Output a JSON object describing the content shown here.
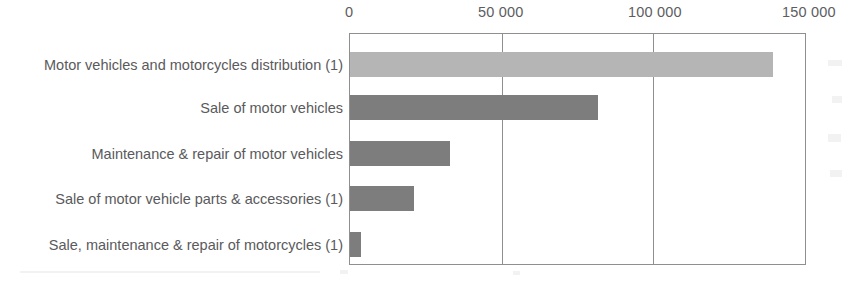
{
  "chart_data": {
    "type": "bar",
    "orientation": "horizontal",
    "title": "",
    "subtitle": "",
    "xlabel": "",
    "ylabel": "",
    "categories": [
      "Motor vehicles and motorcycles distribution (1)",
      "Sale of motor vehicles",
      "Maintenance & repair of motor vehicles",
      "Sale of motor vehicle parts & accessories (1)",
      "Sale, maintenance & repair of motorcycles (1)"
    ],
    "values": [
      139600,
      81800,
      33100,
      21100,
      3600
    ],
    "bar_colors": [
      "#b5b5b5",
      "#7d7d7d",
      "#7d7d7d",
      "#7d7d7d",
      "#7d7d7d"
    ],
    "xlim": [
      0,
      150000
    ],
    "xticks": [
      0,
      50000,
      100000,
      150000
    ],
    "xtick_labels": [
      "0",
      "50 000",
      "100 000",
      "150 000"
    ],
    "grid": true,
    "gridline_values": [
      50000,
      100000
    ],
    "legend": null,
    "legend_position": "none",
    "annotations": []
  },
  "axis": {
    "tick_0": "0",
    "tick_1": "50 000",
    "tick_2": "100 000",
    "tick_3": "150 000"
  },
  "colors": {
    "bar_total": "#b5b5b5",
    "bar_series": "#7d7d7d",
    "axis_line": "#8f8f8f",
    "text": "#5a5a5c",
    "background": "#ffffff"
  }
}
